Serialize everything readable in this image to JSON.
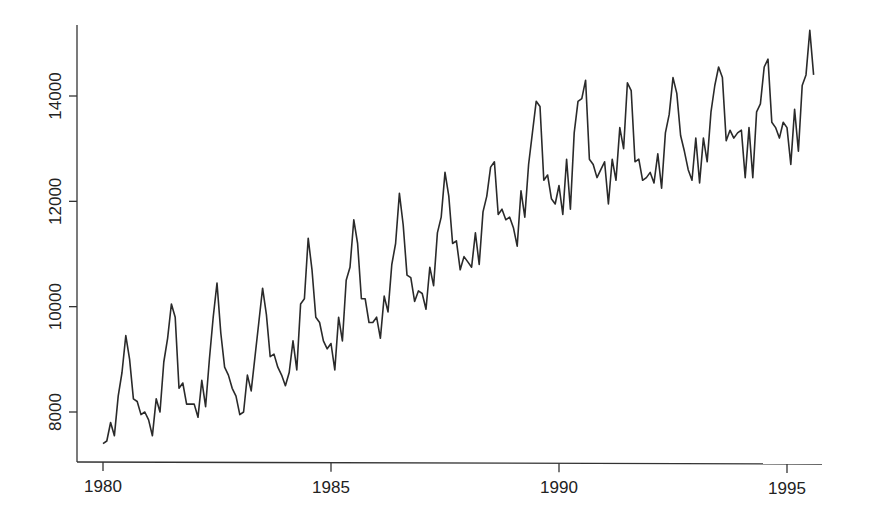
{
  "chart_data": {
    "type": "line",
    "title": "",
    "xlabel": "",
    "ylabel": "",
    "xlim": [
      1979.65,
      1995.9
    ],
    "ylim": [
      7050,
      15350
    ],
    "x_ticks": [
      1980,
      1985,
      1990,
      1995
    ],
    "x_tick_labels": [
      "1980",
      "1985",
      "1990",
      "1995"
    ],
    "y_ticks": [
      8000,
      10000,
      12000,
      14000
    ],
    "y_tick_labels": [
      "8000",
      "10000",
      "12000",
      "14000"
    ],
    "grid": false,
    "legend": null,
    "frequency": "monthly",
    "start": "1980-01",
    "end": "1995-08",
    "series": [
      {
        "name": "series",
        "color": "#2a2a2a",
        "values": [
          7400,
          7450,
          7800,
          7550,
          8300,
          8750,
          9450,
          9000,
          8250,
          8200,
          7950,
          8000,
          7850,
          7550,
          8250,
          8000,
          8950,
          9400,
          10050,
          9800,
          8450,
          8550,
          8150,
          8150,
          8150,
          7900,
          8600,
          8100,
          9000,
          9800,
          10450,
          9500,
          8850,
          8700,
          8450,
          8300,
          7950,
          8000,
          8700,
          8400,
          9050,
          9700,
          10350,
          9850,
          9050,
          9100,
          8850,
          8700,
          8500,
          8750,
          9350,
          8800,
          10050,
          10150,
          11300,
          10700,
          9800,
          9700,
          9350,
          9200,
          9300,
          8800,
          9800,
          9350,
          10500,
          10750,
          11650,
          11200,
          10150,
          10150,
          9700,
          9700,
          9800,
          9400,
          10200,
          9900,
          10800,
          11200,
          12150,
          11550,
          10600,
          10550,
          10100,
          10300,
          10250,
          9950,
          10750,
          10400,
          11400,
          11700,
          12550,
          12100,
          11200,
          11250,
          10700,
          10950,
          10850,
          10750,
          11400,
          10800,
          11800,
          12100,
          12650,
          12750,
          11750,
          11850,
          11650,
          11700,
          11500,
          11150,
          12200,
          11700,
          12700,
          13300,
          13900,
          13800,
          12400,
          12500,
          12050,
          11950,
          12300,
          11750,
          12800,
          11850,
          13300,
          13900,
          13950,
          14300,
          12800,
          12700,
          12450,
          12600,
          12750,
          11950,
          12800,
          12400,
          13400,
          13000,
          14250,
          14100,
          12750,
          12800,
          12400,
          12450,
          12550,
          12350,
          12900,
          12250,
          13300,
          13650,
          14350,
          14050,
          13250,
          12950,
          12600,
          12400,
          13200,
          12350,
          13200,
          12750,
          13700,
          14200,
          14550,
          14350,
          13150,
          13350,
          13200,
          13300,
          13350,
          12450,
          13400,
          12450,
          13700,
          13850,
          14550,
          14700,
          13500,
          13400,
          13200,
          13500,
          13400,
          12700,
          13750,
          12950,
          14200,
          14400,
          15250,
          14400
        ]
      }
    ]
  }
}
